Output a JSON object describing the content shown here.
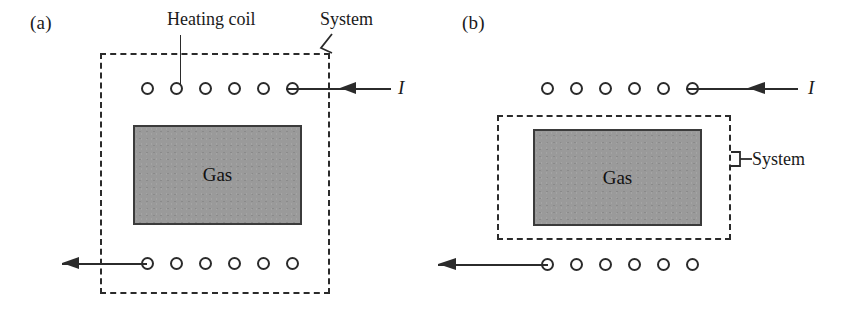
{
  "figure": {
    "background": "#ffffff",
    "ink": "#2b2b2b",
    "gas_fill": "#9a9a9a",
    "gas_border": "#3b3b3b"
  },
  "panels": [
    {
      "id": "a",
      "label": "(a)",
      "gas_label": "Gas",
      "current_label": "I",
      "annotations": [
        {
          "name": "heating-coil",
          "text": "Heating coil"
        },
        {
          "name": "system",
          "text": "System"
        }
      ],
      "coil_top_count": 6,
      "coil_bottom_count": 6,
      "boundary_includes_coil": true
    },
    {
      "id": "b",
      "label": "(b)",
      "gas_label": "Gas",
      "current_label": "I",
      "annotations": [
        {
          "name": "system",
          "text": "System"
        }
      ],
      "coil_top_count": 6,
      "coil_bottom_count": 6,
      "boundary_includes_coil": false
    }
  ]
}
